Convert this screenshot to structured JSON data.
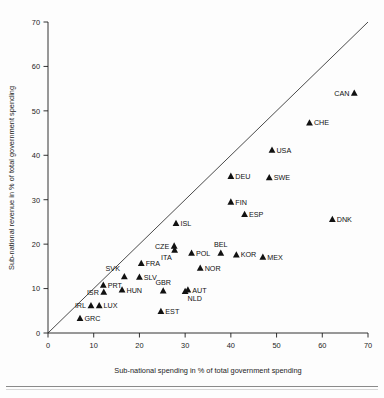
{
  "chart_data": {
    "type": "scatter",
    "title": "",
    "subtitle": "",
    "xlabel": "Sub-national spending in % of total government spending",
    "ylabel": "Sub-national revenue in % of total government spending",
    "xlim": [
      0,
      70
    ],
    "ylim": [
      0,
      70
    ],
    "xticks": [
      0,
      10,
      20,
      30,
      40,
      50,
      60,
      70
    ],
    "yticks": [
      0,
      10,
      20,
      30,
      40,
      50,
      60,
      70
    ],
    "xtick_labels": [
      "0",
      "10",
      "20",
      "30",
      "40",
      "50",
      "60",
      "70"
    ],
    "ytick_labels": [
      "0",
      "10",
      "20",
      "30",
      "40",
      "50",
      "60",
      "70"
    ],
    "grid": false,
    "legend": "none",
    "marker": "triangle",
    "marker_color": "#111111",
    "annotations": [
      {
        "text": "45-degree reference line",
        "type": "line",
        "from": [
          0,
          0
        ],
        "to": [
          70,
          70
        ]
      }
    ],
    "points": [
      {
        "label": "CAN",
        "x": 67.0,
        "y": 54.0,
        "label_pos": "left"
      },
      {
        "label": "CHE",
        "x": 57.2,
        "y": 47.3,
        "label_pos": "right"
      },
      {
        "label": "USA",
        "x": 49.0,
        "y": 41.2,
        "label_pos": "right"
      },
      {
        "label": "SWE",
        "x": 48.4,
        "y": 35.0,
        "label_pos": "right"
      },
      {
        "label": "DEU",
        "x": 40.0,
        "y": 35.3,
        "label_pos": "right"
      },
      {
        "label": "FIN",
        "x": 40.0,
        "y": 29.5,
        "label_pos": "right"
      },
      {
        "label": "ESP",
        "x": 43.0,
        "y": 26.7,
        "label_pos": "right"
      },
      {
        "label": "DNK",
        "x": 62.2,
        "y": 25.6,
        "label_pos": "right"
      },
      {
        "label": "ISL",
        "x": 28.0,
        "y": 24.7,
        "label_pos": "right"
      },
      {
        "label": "CZE",
        "x": 27.6,
        "y": 19.6,
        "label_pos": "left"
      },
      {
        "label": "ITA",
        "x": 27.7,
        "y": 18.7,
        "label_pos": "below-left"
      },
      {
        "label": "POL",
        "x": 31.4,
        "y": 18.0,
        "label_pos": "right"
      },
      {
        "label": "BEL",
        "x": 37.8,
        "y": 18.0,
        "label_pos": "above"
      },
      {
        "label": "KOR",
        "x": 41.2,
        "y": 17.6,
        "label_pos": "right"
      },
      {
        "label": "MEX",
        "x": 47.0,
        "y": 17.1,
        "label_pos": "right"
      },
      {
        "label": "FRA",
        "x": 20.4,
        "y": 15.7,
        "label_pos": "right"
      },
      {
        "label": "NOR",
        "x": 33.3,
        "y": 14.6,
        "label_pos": "right"
      },
      {
        "label": "SVK",
        "x": 16.7,
        "y": 12.7,
        "label_pos": "above-left"
      },
      {
        "label": "SLV",
        "x": 20.0,
        "y": 12.6,
        "label_pos": "right"
      },
      {
        "label": "PRT",
        "x": 12.1,
        "y": 10.8,
        "label_pos": "right"
      },
      {
        "label": "GBR",
        "x": 25.2,
        "y": 9.5,
        "label_pos": "above"
      },
      {
        "label": "AUT",
        "x": 30.6,
        "y": 9.7,
        "label_pos": "right"
      },
      {
        "label": "NLD",
        "x": 30.0,
        "y": 9.4,
        "label_pos": "below-right"
      },
      {
        "label": "HUN",
        "x": 16.2,
        "y": 9.7,
        "label_pos": "right"
      },
      {
        "label": "ISR",
        "x": 12.2,
        "y": 9.2,
        "label_pos": "left"
      },
      {
        "label": "LUX",
        "x": 11.2,
        "y": 6.2,
        "label_pos": "right"
      },
      {
        "label": "IRL",
        "x": 9.4,
        "y": 6.2,
        "label_pos": "left"
      },
      {
        "label": "EST",
        "x": 24.7,
        "y": 4.9,
        "label_pos": "right"
      },
      {
        "label": "GRC",
        "x": 7.0,
        "y": 3.3,
        "label_pos": "right"
      }
    ]
  },
  "axes": {
    "x_title": "Sub-national spending in % of total government spending",
    "y_title": "Sub-national revenue in % of total government spending"
  }
}
